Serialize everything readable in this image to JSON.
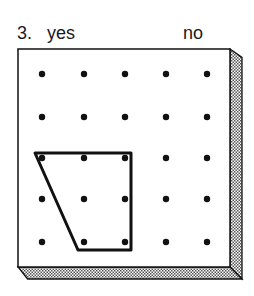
{
  "question": {
    "number": "3.",
    "option_yes": "yes",
    "option_no": "no"
  },
  "geoboard": {
    "rows": 5,
    "cols": 5,
    "dot_x": [
      42,
      84,
      125,
      166,
      207
    ],
    "dot_y": [
      74,
      117,
      158,
      199,
      242
    ],
    "board": {
      "left": 18,
      "top": 49,
      "right": 230,
      "bottom": 267,
      "depth": 12
    },
    "shape": {
      "type": "trapezoid",
      "points": [
        [
          35,
          153
        ],
        [
          131,
          153
        ],
        [
          131,
          250
        ],
        [
          78,
          250
        ]
      ]
    },
    "colors": {
      "ink": "#111111",
      "board": "#ffffff",
      "shadow": "#9a9a9a"
    }
  }
}
